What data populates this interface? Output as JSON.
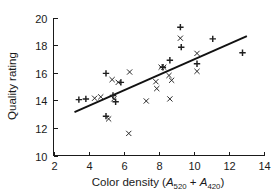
{
  "figure": {
    "background": "#ffffff",
    "ink_color": "#1a1a1a"
  },
  "axes": {
    "x_title_prefix": "Color density  (",
    "x_title_a1": "A",
    "x_title_sub1": "520",
    "x_title_plus": " + ",
    "x_title_a2": "A",
    "x_title_sub2": "420",
    "x_title_suffix": ")",
    "y_title": "Quality rating",
    "x_ticks": [
      "2",
      "4",
      "6",
      "8",
      "10",
      "12",
      "14"
    ],
    "y_ticks": [
      "10",
      "12",
      "14",
      "16",
      "18",
      "20"
    ]
  },
  "chart_data": {
    "type": "scatter",
    "title": "",
    "xlabel": "Color density (A520 + A420)",
    "ylabel": "Quality rating",
    "xlim": [
      2,
      14
    ],
    "ylim": [
      10,
      20
    ],
    "xticks": [
      2,
      4,
      6,
      8,
      10,
      12,
      14
    ],
    "yticks": [
      10,
      12,
      14,
      16,
      18,
      20
    ],
    "grid": false,
    "legend": "none",
    "series": [
      {
        "name": "plus-markers",
        "marker": "plus",
        "color": "#1f1f1f",
        "points": [
          [
            3.45,
            14.05
          ],
          [
            3.85,
            14.1
          ],
          [
            5.4,
            14.35
          ],
          [
            5.55,
            13.9
          ],
          [
            5.0,
            15.95
          ],
          [
            5.85,
            15.3
          ],
          [
            5.0,
            12.85
          ],
          [
            8.25,
            16.4
          ],
          [
            8.65,
            16.9
          ],
          [
            9.25,
            19.3
          ],
          [
            9.3,
            17.85
          ],
          [
            10.2,
            16.65
          ],
          [
            11.1,
            18.45
          ],
          [
            12.8,
            17.45
          ]
        ]
      },
      {
        "name": "cross-markers",
        "marker": "cross",
        "color": "#3a3a3a",
        "points": [
          [
            4.35,
            14.15
          ],
          [
            4.7,
            14.25
          ],
          [
            5.45,
            14.1
          ],
          [
            5.35,
            15.5
          ],
          [
            5.7,
            15.3
          ],
          [
            5.15,
            12.65
          ],
          [
            6.3,
            11.6
          ],
          [
            6.35,
            16.05
          ],
          [
            7.3,
            13.95
          ],
          [
            7.85,
            15.35
          ],
          [
            7.9,
            14.85
          ],
          [
            8.15,
            16.4
          ],
          [
            8.3,
            16.4
          ],
          [
            8.6,
            15.8
          ],
          [
            8.65,
            14.1
          ],
          [
            8.75,
            15.45
          ],
          [
            9.25,
            18.5
          ],
          [
            10.2,
            17.4
          ],
          [
            10.2,
            16.1
          ]
        ]
      }
    ],
    "fit_line": {
      "name": "regression-line",
      "x_start": 3.2,
      "y_start": 13.15,
      "x_end": 13.05,
      "y_end": 18.65,
      "color": "#111111"
    }
  }
}
